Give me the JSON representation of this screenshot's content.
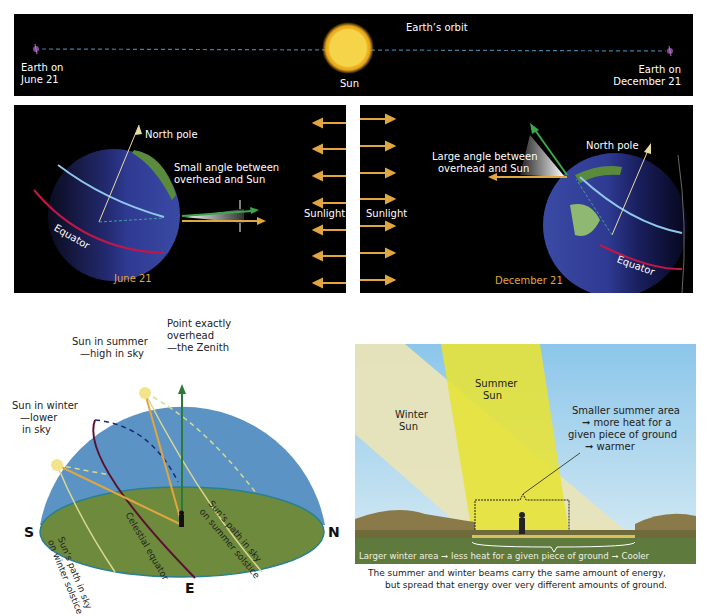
{
  "top_banner": {
    "orbit_label": "Earth’s orbit",
    "sun_label": "Sun",
    "earth_june": [
      "Earth on",
      "June 21"
    ],
    "earth_december": [
      "Earth on",
      "December 21"
    ]
  },
  "june_panel": {
    "north_pole": "North pole",
    "angle_note": [
      "Small angle between",
      "overhead and Sun"
    ],
    "equator": "Equator",
    "date": "June 21",
    "sunlight": "Sunlight"
  },
  "december_panel": {
    "north_pole": "North pole",
    "angle_note": [
      "Large angle between",
      "overhead and Sun"
    ],
    "equator": "Equator",
    "date": "December 21",
    "sunlight": "Sunlight"
  },
  "sky_dome": {
    "zenith": [
      "Point exactly",
      "overhead",
      "—the Zenith"
    ],
    "summer_sun": [
      "Sun in summer",
      "—high in sky"
    ],
    "winter_sun": [
      "Sun in winter",
      "—lower",
      "in sky"
    ],
    "winter_path": [
      "Sun’s path in sky",
      "on winter solstice"
    ],
    "celestial_equator": "Celestial equator",
    "summer_path": [
      "Sun’s path in sky",
      "on summer solstice"
    ],
    "directions": {
      "south": "S",
      "north": "N",
      "east": "E"
    }
  },
  "beam_panel": {
    "summer_sun": [
      "Summer",
      "Sun"
    ],
    "winter_sun": [
      "Winter",
      "Sun"
    ],
    "summer_note": [
      "Smaller summer area",
      "➞ more heat for a",
      "given piece of ground",
      "➞ warmer"
    ],
    "winter_note": "Larger winter area ➞ less heat for a given piece of ground ➞ Cooler",
    "caption": [
      "The summer and winter beams carry the same amount of energy,",
      "but spread that energy over very different amounts of ground."
    ]
  },
  "colors": {
    "panel_bg": "#000000",
    "sunlight_arrow": "#e0a640",
    "equator": "#c0174a",
    "orbit_line": "#3f7fa0",
    "sky": "#5b93c4",
    "ground": "#6e8a3c",
    "summer_beam": "#e6e23a",
    "winter_beam": "#e8e4b8"
  }
}
